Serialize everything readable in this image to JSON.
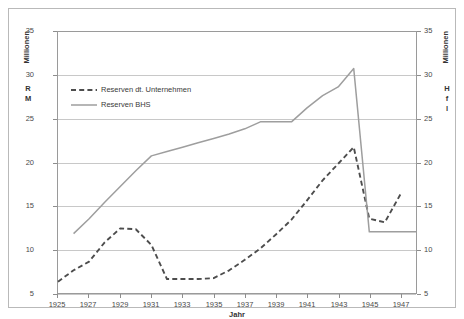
{
  "chart_data": {
    "type": "line",
    "title": "",
    "xlabel": "Jahr",
    "ylabel_left": "Millionen",
    "ylabel_left_unit": "R\nM",
    "ylabel_right": "Millionen",
    "ylabel_right_unit": "H\nf\nl",
    "xlim": [
      1925,
      1948
    ],
    "ylim": [
      5,
      35
    ],
    "y2lim": [
      5,
      35
    ],
    "grid": true,
    "legend_position": "upper-left-inside",
    "x_tick_labels": [
      "1925",
      "1927",
      "1929",
      "1931",
      "1933",
      "1935",
      "1937",
      "1939",
      "1941",
      "1943",
      "1945",
      "1947"
    ],
    "x_tick_values": [
      1925,
      1927,
      1929,
      1931,
      1933,
      1935,
      1937,
      1939,
      1941,
      1943,
      1945,
      1947
    ],
    "y_tick_labels": [
      "5",
      "10",
      "15",
      "20",
      "25",
      "30",
      "35"
    ],
    "y_tick_values": [
      5,
      10,
      15,
      20,
      25,
      30,
      35
    ],
    "y2_tick_labels": [
      "5",
      "10",
      "15",
      "20",
      "25",
      "30",
      "35"
    ],
    "y2_tick_values": [
      5,
      10,
      15,
      20,
      25,
      30,
      35
    ],
    "x": [
      1925,
      1926,
      1927,
      1928,
      1929,
      1930,
      1931,
      1932,
      1933,
      1934,
      1935,
      1936,
      1937,
      1938,
      1939,
      1940,
      1941,
      1942,
      1943,
      1944,
      1945,
      1946,
      1947
    ],
    "series": [
      {
        "name": "Reserven dt. Unternehmen",
        "style": "dashed",
        "color": "#4d4d4d",
        "axis": "left",
        "x": [
          1925,
          1926,
          1927,
          1928,
          1929,
          1930,
          1931,
          1932,
          1933,
          1934,
          1935,
          1936,
          1937,
          1938,
          1939,
          1940,
          1941,
          1942,
          1943,
          1944,
          1945,
          1946,
          1947
        ],
        "values": [
          6.3,
          7.6,
          8.6,
          10.8,
          12.4,
          12.3,
          10.5,
          6.6,
          6.6,
          6.6,
          6.7,
          7.6,
          8.8,
          10.1,
          11.7,
          13.4,
          15.6,
          17.9,
          19.8,
          21.7,
          13.5,
          13.1,
          16.3
        ]
      },
      {
        "name": "Reserven BHS",
        "style": "solid",
        "color": "#9e9e9e",
        "axis": "right",
        "x": [
          1926,
          1927,
          1928,
          1929,
          1930,
          1931,
          1932,
          1933,
          1934,
          1935,
          1936,
          1937,
          1938,
          1939,
          1940,
          1941,
          1942,
          1943,
          1944,
          1945,
          1946,
          1947,
          1948
        ],
        "values": [
          11.8,
          13.5,
          15.4,
          17.2,
          19.0,
          20.7,
          21.2,
          21.7,
          22.2,
          22.7,
          23.2,
          23.8,
          24.6,
          24.6,
          24.6,
          26.2,
          27.6,
          28.6,
          30.7,
          12.0,
          12.0,
          12.0,
          12.0
        ]
      }
    ]
  },
  "legend": {
    "items": [
      {
        "label": "Reserven dt. Unternehmen",
        "style": "dashed",
        "color": "#4d4d4d"
      },
      {
        "label": "Reserven BHS",
        "style": "solid",
        "color": "#9e9e9e"
      }
    ]
  },
  "axes": {
    "x_title": "Jahr",
    "left_title": "Millionen",
    "left_unit_lines": [
      "R",
      "M"
    ],
    "right_title": "Millionen",
    "right_unit_lines": [
      "H",
      "f",
      "l"
    ]
  },
  "colors": {
    "grid": "#c8c8c8",
    "axis": "#9a9a9a",
    "frame": "#b9b9b9",
    "series_dashed": "#4d4d4d",
    "series_solid": "#9e9e9e",
    "background": "#ffffff",
    "tick_text": "#4a4a4a"
  }
}
